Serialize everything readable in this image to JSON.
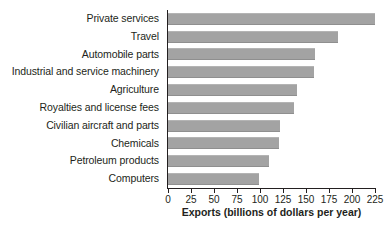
{
  "chart_data": {
    "type": "bar",
    "orientation": "horizontal",
    "title": "",
    "xlabel": "Exports (billions of dollars per year)",
    "ylabel": "",
    "xlim": [
      0,
      225
    ],
    "xticks": [
      0,
      25,
      50,
      75,
      100,
      125,
      150,
      175,
      200,
      225
    ],
    "grid": false,
    "legend": false,
    "bar_color": "#a3a3a3",
    "axis_color": "#231f20",
    "categories": [
      "Private services",
      "Travel",
      "Automobile parts",
      "Industrial and service machinery",
      "Agriculture",
      "Royalties and license fees",
      "Civilian aircraft and parts",
      "Chemicals",
      "Petroleum products",
      "Computers"
    ],
    "values": [
      225,
      185,
      160,
      159,
      140,
      137,
      122,
      121,
      110,
      99
    ]
  }
}
